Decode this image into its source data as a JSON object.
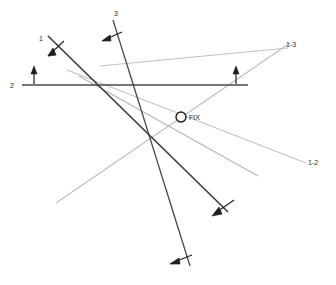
{
  "diagram": {
    "background_color": "#ffffff",
    "width": 336,
    "height": 285,
    "colors": {
      "dark_line": "#3a3a3a",
      "mid_line": "#7a7a7a",
      "light_line": "#b9b9b9",
      "very_light_line": "#c9c9c9",
      "text": "#2b2b2b",
      "arrow": "#1f1f1f"
    },
    "labels": [
      {
        "id": "label-1",
        "text": "1",
        "x": 41,
        "y": 41
      },
      {
        "id": "label-2",
        "text": "2",
        "x": 12,
        "y": 86
      },
      {
        "id": "label-3",
        "text": "3",
        "x": 116,
        "y": 16
      },
      {
        "id": "label-1-3",
        "text": "1-3",
        "x": 286,
        "y": 46
      },
      {
        "id": "label-1-2",
        "text": "1-2",
        "x": 308,
        "y": 164
      },
      {
        "id": "label-fix",
        "text": "FIX",
        "x": 190,
        "y": 120
      }
    ],
    "fix_marker": {
      "name": "fix-point",
      "cx": 181,
      "cy": 117,
      "r": 5,
      "stroke": "#1a1a1a",
      "stroke_width": 1.4
    },
    "lines": [
      {
        "id": "lop-1",
        "x1": 48,
        "y1": 36,
        "x2": 228,
        "y2": 212,
        "color": "#3a3a3a",
        "width": 1.5
      },
      {
        "id": "lop-2",
        "x1": 22,
        "y1": 85,
        "x2": 248,
        "y2": 85,
        "color": "#4a4a4a",
        "width": 1.4
      },
      {
        "id": "lop-3",
        "x1": 113,
        "y1": 20,
        "x2": 190,
        "y2": 266,
        "color": "#4a4a4a",
        "width": 1.3
      },
      {
        "id": "lop-1-3",
        "x1": 100,
        "y1": 66,
        "x2": 288,
        "y2": 48,
        "color": "#c0c0c0",
        "width": 1.1
      },
      {
        "id": "lop-1-3-adv",
        "x1": 56,
        "y1": 203,
        "x2": 290,
        "y2": 43,
        "color": "#bdbdbd",
        "width": 1.1
      },
      {
        "id": "lop-1-2",
        "x1": 67,
        "y1": 70,
        "x2": 306,
        "y2": 163,
        "color": "#c3c3c3",
        "width": 1.1
      },
      {
        "id": "lop-1-2-adv",
        "x1": 79,
        "y1": 76,
        "x2": 258,
        "y2": 176,
        "color": "#b5b5b5",
        "width": 1.1
      }
    ],
    "arrows": [
      {
        "id": "arrow-lop-1",
        "direction": "down-left",
        "x": 53,
        "y": 53
      },
      {
        "id": "arrow-lop-2-left",
        "direction": "up",
        "x": 34,
        "y": 76
      },
      {
        "id": "arrow-lop-2-right",
        "direction": "up",
        "x": 236,
        "y": 76
      },
      {
        "id": "arrow-lop-3",
        "direction": "left",
        "x": 113,
        "y": 37
      },
      {
        "id": "arrow-lop-1-end",
        "direction": "down-left",
        "x": 219,
        "y": 210
      },
      {
        "id": "arrow-lop-3-end",
        "direction": "left",
        "x": 180,
        "y": 260
      }
    ]
  }
}
